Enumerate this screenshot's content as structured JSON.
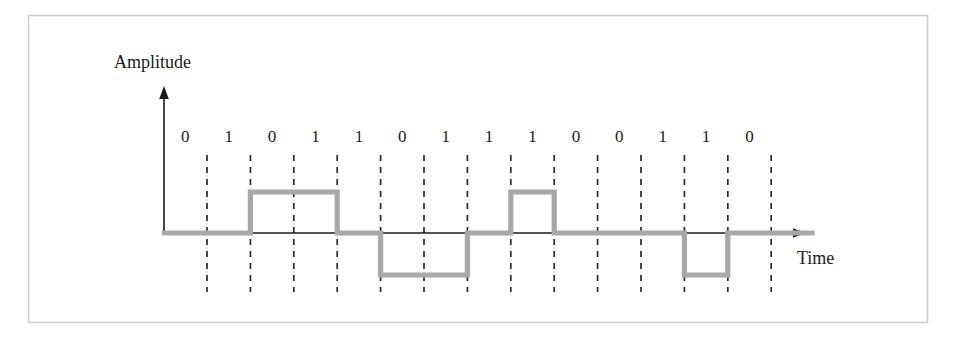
{
  "figure": {
    "amplitude_axis_label": "Amplitude",
    "time_axis_label": "Time",
    "signal_color": "#a8a8a8",
    "axis_color": "#1a1a1a",
    "grid_color": "#2a2a2a",
    "frame_color": "#cfcfcf",
    "background_color": "#ffffff"
  },
  "bits": [
    {
      "index": 0,
      "value": "0"
    },
    {
      "index": 1,
      "value": "1"
    },
    {
      "index": 2,
      "value": "0"
    },
    {
      "index": 3,
      "value": "1"
    },
    {
      "index": 4,
      "value": "1"
    },
    {
      "index": 5,
      "value": "0"
    },
    {
      "index": 6,
      "value": "1"
    },
    {
      "index": 7,
      "value": "1"
    },
    {
      "index": 8,
      "value": "1"
    },
    {
      "index": 9,
      "value": "0"
    },
    {
      "index": 10,
      "value": "0"
    },
    {
      "index": 11,
      "value": "1"
    },
    {
      "index": 12,
      "value": "1"
    },
    {
      "index": 13,
      "value": "0"
    }
  ],
  "chart_data": {
    "type": "line",
    "xlabel": "Time",
    "ylabel": "Amplitude",
    "bit_sequence": "01011011100110",
    "categories": [
      "0",
      "1",
      "0",
      "1",
      "1",
      "0",
      "1",
      "1",
      "1",
      "0",
      "0",
      "1",
      "1",
      "0"
    ],
    "series": [
      {
        "name": "Encoded signal level",
        "values": [
          0,
          1,
          1,
          0,
          -1,
          -1,
          0,
          1,
          0,
          0,
          0,
          -1,
          0,
          0
        ]
      }
    ],
    "ylim": [
      -1,
      1
    ],
    "level_names": {
      "1": "positive",
      "0": "zero",
      "-1": "negative"
    },
    "grid": true,
    "legend": "none",
    "annotations": [
      "Positive pulse spans bit slots 2-3",
      "Negative pulse spans bit slots 5-6",
      "Positive pulse spans bit slot 8",
      "Negative pulse spans bit slot 12"
    ],
    "geometry": {
      "slot_count": 14,
      "first_gridline_x": 207,
      "slot_width": 43.4,
      "baseline_y": 233,
      "high_y": 192,
      "low_y": 275,
      "y_axis_x": 164,
      "y_axis_top": 88,
      "x_axis_end": 805
    }
  }
}
